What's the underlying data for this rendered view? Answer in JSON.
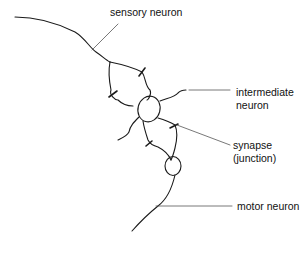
{
  "diagram": {
    "labels": {
      "sensory_neuron": "sensory neuron",
      "intermediate_neuron_line1": "intermediate",
      "intermediate_neuron_line2": "neuron",
      "synapse_line1": "synapse",
      "synapse_line2": "(junction)",
      "motor_neuron": "motor neuron"
    },
    "colors": {
      "stroke": "#1a1a1a",
      "leader": "#555555",
      "background": "#ffffff"
    }
  }
}
